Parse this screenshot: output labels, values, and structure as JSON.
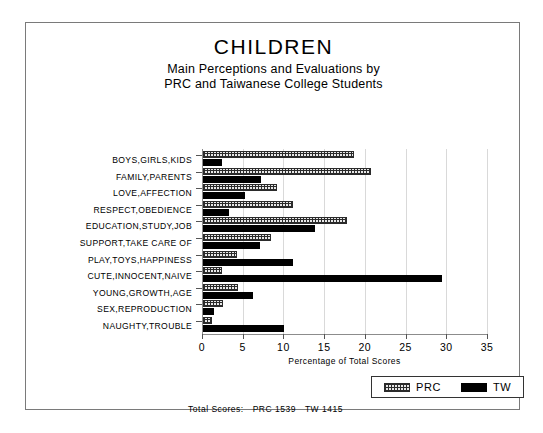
{
  "chart_data": {
    "type": "bar",
    "orientation": "horizontal",
    "title": "CHILDREN",
    "subtitle_line1": "Main Perceptions and Evaluations by",
    "subtitle_line2": "PRC and Taiwanese College Students",
    "xlabel": "Percentage of Total Scores",
    "ylabel": "",
    "xlim": [
      0,
      35
    ],
    "xticks": [
      0,
      5,
      10,
      15,
      20,
      25,
      30,
      35
    ],
    "grid": true,
    "legend_position": "bottom-right",
    "categories": [
      "BOYS,GIRLS,KIDS",
      "FAMILY,PARENTS",
      "LOVE,AFFECTION",
      "RESPECT,OBEDIENCE",
      "EDUCATION,STUDY,JOB",
      "SUPPORT,TAKE CARE OF",
      "PLAY,TOYS,HAPPINESS",
      "CUTE,INNOCENT,NAIVE",
      "YOUNG,GROWTH,AGE",
      "SEX,REPRODUCTION",
      "NAUGHTY,TROUBLE"
    ],
    "series": [
      {
        "name": "PRC",
        "fill": "hatched",
        "values": [
          18.5,
          20.6,
          9.1,
          11.0,
          17.7,
          8.4,
          4.2,
          2.3,
          4.3,
          2.4,
          1.1
        ]
      },
      {
        "name": "TW",
        "fill": "solid-black",
        "values": [
          2.3,
          7.1,
          5.2,
          3.2,
          13.8,
          7.0,
          11.0,
          29.3,
          6.1,
          1.3,
          9.9
        ]
      }
    ]
  },
  "legend": {
    "items": [
      {
        "label": "PRC",
        "swatch": "hatched-swatch"
      },
      {
        "label": "TW",
        "swatch": "solid-black-swatch"
      }
    ]
  },
  "footer": {
    "label": "Total Scores:",
    "prc": "PRC 1539",
    "tw": "TW 1415"
  }
}
